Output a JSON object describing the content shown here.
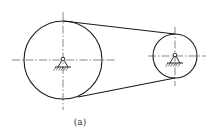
{
  "diagram": {
    "caption": "(a)",
    "colors": {
      "line": "#1a1a1a",
      "centerline": "#555555",
      "background": "#ffffff"
    },
    "pulleys": [
      {
        "name": "large-pulley",
        "cx": 63,
        "cy": 60,
        "r": 39,
        "centerline_h": [
          12,
          115
        ],
        "centerline_v": [
          12,
          110
        ]
      },
      {
        "name": "small-pulley",
        "cx": 175,
        "cy": 56,
        "r": 22,
        "centerline_h": [
          148,
          206
        ],
        "centerline_v": [
          27,
          86
        ]
      }
    ],
    "belt": {
      "upper": {
        "x1": 63,
        "y1": 21,
        "x2": 175,
        "y2": 34
      },
      "lower": {
        "x1": 78,
        "y1": 97,
        "x2": 175,
        "y2": 78
      }
    },
    "supports": [
      {
        "name": "large-pulley-support",
        "cx": 63,
        "cy": 60
      },
      {
        "name": "small-pulley-support",
        "cx": 175,
        "cy": 56
      }
    ]
  }
}
